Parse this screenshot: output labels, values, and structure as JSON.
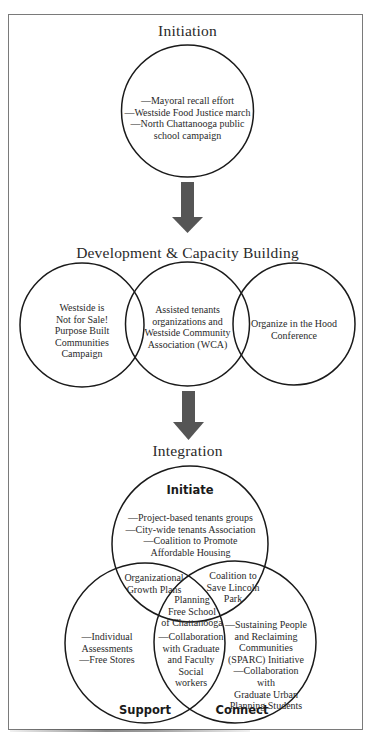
{
  "stages": {
    "initiation": {
      "title": "Initiation",
      "circle_text": "—Mayoral recall effort\n—Westside Food Justice march\n—North Chattanooga public\nschool campaign"
    },
    "development": {
      "title": "Development & Capacity Building",
      "circles": [
        {
          "text": "Westside is\nNot for Sale!\nPurpose Built\nCommunities\nCampaign"
        },
        {
          "text": "Assisted tenants\norganizations and\nWestside Community\nAssociation (WCA)"
        },
        {
          "text": "Organize in the Hood\nConference"
        }
      ]
    },
    "integration": {
      "title": "Integration",
      "venn": {
        "initiate": {
          "label": "Initiate",
          "text": "—Project-based tenants groups\n—City-wide tenants Association\n—Coalition to Promote\nAffordable Housing"
        },
        "support": {
          "label": "Support",
          "text": "—Individual\nAssessments\n—Free Stores"
        },
        "connect": {
          "label": "Connect",
          "text": "—Sustaining People\nand Reclaiming\nCommunities\n(SPARC) Initiative\n—Collaboration with\nGraduate Urban\nPlanning Students"
        },
        "initiate_support": {
          "text": "Organizational\nGrowth Plans"
        },
        "initiate_connect": {
          "text": "Coalition to\nSave Lincoln\nPark"
        },
        "support_connect": {
          "text": "—Collaboration\nwith Graduate\nand Faculty\nSocial\nworkers"
        },
        "center": {
          "text": "Planning\nFree School\nof Chattanooga"
        }
      }
    }
  },
  "colors": {
    "arrow": "#555555",
    "stroke": "#1a1a1a",
    "frame": "#7a7a7a",
    "text": "#2a2a2a"
  }
}
